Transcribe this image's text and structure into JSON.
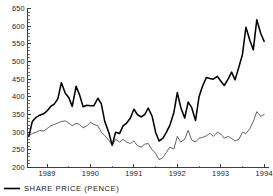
{
  "chart_data": {
    "type": "line",
    "title": "",
    "subtitle": "",
    "xlabel": "",
    "ylabel": "",
    "ylim": [
      200,
      650
    ],
    "xlim": [
      1988.55,
      1994.1
    ],
    "ytick_labels": [
      "200",
      "250",
      "300",
      "350",
      "400",
      "450",
      "500",
      "550",
      "600",
      "650"
    ],
    "ytick_values": [
      200,
      250,
      300,
      350,
      400,
      450,
      500,
      550,
      600,
      650
    ],
    "ytick_minor_step": 10,
    "xtick_labels": [
      "1989",
      "1990",
      "1991",
      "1992",
      "1993",
      "1994"
    ],
    "xtick_values": [
      1989,
      1990,
      1991,
      1992,
      1993,
      1994
    ],
    "grid": false,
    "legend_position": "below-left",
    "legend": [
      {
        "label": "SHARE  PRICE  (PENCE)",
        "marker": "solid-line",
        "color": "#000000"
      }
    ],
    "series": [
      {
        "name": "SHARE  PRICE  (PENCE)",
        "style": "bold",
        "color": "#000000",
        "x": [
          1988.58,
          1988.66,
          1988.75,
          1988.83,
          1988.92,
          1989.0,
          1989.08,
          1989.17,
          1989.25,
          1989.33,
          1989.42,
          1989.5,
          1989.58,
          1989.67,
          1989.75,
          1989.83,
          1989.92,
          1990.0,
          1990.08,
          1990.17,
          1990.25,
          1990.33,
          1990.42,
          1990.5,
          1990.58,
          1990.67,
          1990.75,
          1990.83,
          1990.92,
          1991.0,
          1991.08,
          1991.17,
          1991.25,
          1991.33,
          1991.42,
          1991.5,
          1991.58,
          1991.67,
          1991.75,
          1991.83,
          1991.92,
          1992.0,
          1992.08,
          1992.17,
          1992.25,
          1992.33,
          1992.42,
          1992.5,
          1992.58,
          1992.67,
          1992.75,
          1992.83,
          1992.92,
          1993.0,
          1993.08,
          1993.17,
          1993.25,
          1993.33,
          1993.42,
          1993.5,
          1993.58,
          1993.67,
          1993.75,
          1993.83,
          1993.92,
          1994.0
        ],
        "values": [
          288,
          330,
          342,
          348,
          352,
          360,
          372,
          380,
          395,
          440,
          410,
          398,
          373,
          430,
          405,
          372,
          376,
          375,
          375,
          396,
          380,
          330,
          300,
          263,
          300,
          296,
          318,
          325,
          340,
          365,
          350,
          343,
          350,
          368,
          345,
          300,
          275,
          283,
          300,
          320,
          355,
          412,
          370,
          340,
          385,
          370,
          333,
          400,
          430,
          455,
          452,
          450,
          458,
          445,
          432,
          450,
          470,
          448,
          485,
          520,
          597,
          560,
          533,
          618,
          580,
          557
        ]
      },
      {
        "name": "index-line",
        "style": "thin",
        "color": "#2f2f2f",
        "x": [
          1988.58,
          1988.66,
          1988.75,
          1988.83,
          1988.92,
          1989.0,
          1989.08,
          1989.17,
          1989.25,
          1989.33,
          1989.42,
          1989.5,
          1989.58,
          1989.67,
          1989.75,
          1989.83,
          1989.92,
          1990.0,
          1990.08,
          1990.17,
          1990.25,
          1990.33,
          1990.42,
          1990.5,
          1990.58,
          1990.67,
          1990.75,
          1990.83,
          1990.92,
          1991.0,
          1991.08,
          1991.17,
          1991.25,
          1991.33,
          1991.42,
          1991.5,
          1991.58,
          1991.67,
          1991.75,
          1991.83,
          1991.92,
          1992.0,
          1992.08,
          1992.17,
          1992.25,
          1992.33,
          1992.42,
          1992.5,
          1992.58,
          1992.67,
          1992.75,
          1992.83,
          1992.92,
          1993.0,
          1993.08,
          1993.17,
          1993.25,
          1993.33,
          1993.42,
          1993.5,
          1993.58,
          1993.67,
          1993.75,
          1993.83,
          1993.92,
          1994.0
        ],
        "values": [
          290,
          296,
          300,
          305,
          303,
          310,
          318,
          322,
          326,
          330,
          332,
          326,
          318,
          325,
          322,
          312,
          318,
          328,
          322,
          318,
          300,
          290,
          278,
          262,
          280,
          272,
          280,
          272,
          268,
          275,
          262,
          258,
          266,
          268,
          250,
          240,
          222,
          228,
          243,
          258,
          252,
          288,
          272,
          280,
          305,
          278,
          272,
          283,
          285,
          290,
          297,
          288,
          300,
          295,
          283,
          288,
          282,
          275,
          280,
          300,
          296,
          310,
          330,
          358,
          345,
          350
        ]
      }
    ]
  },
  "legend": {
    "share_price_label": "SHARE  PRICE  (PENCE)"
  }
}
